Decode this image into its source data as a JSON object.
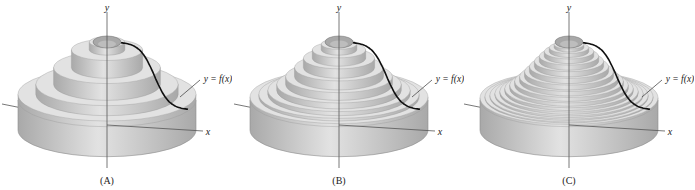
{
  "figure": {
    "panels": [
      {
        "id": "A",
        "label": "(A)",
        "curve_label": "y = f(x)",
        "x_axis": "x",
        "y_axis": "y",
        "shells": 5,
        "offset": 0
      },
      {
        "id": "B",
        "label": "(B)",
        "curve_label": "y = f(x)",
        "x_axis": "x",
        "y_axis": "y",
        "shells": 10,
        "offset": 232
      },
      {
        "id": "C",
        "label": "(C)",
        "curve_label": "y = f(x)",
        "x_axis": "x",
        "y_axis": "y",
        "shells": 18,
        "offset": 462
      }
    ],
    "colors": {
      "solid": "#c9c9c9",
      "solid_dark": "#a9a9a9",
      "solid_light": "#e2e2e2",
      "curve": "#111111",
      "axis": "#555555",
      "text": "#222222"
    }
  }
}
